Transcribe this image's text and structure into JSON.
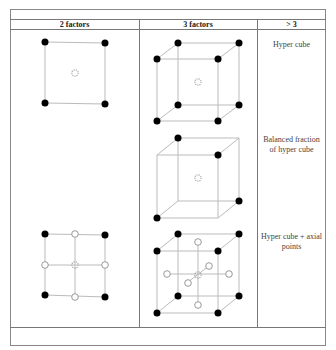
{
  "table": {
    "headers": [
      "2 factors",
      "3 factors",
      "> 3"
    ],
    "rows": [
      {
        "label": "Hyper cube"
      },
      {
        "label": "Balanced fraction of hyper cube",
        "label_line1": "Balanced fraction",
        "label_line2": "of hyper cube"
      },
      {
        "label": "Hyper cube + axial points",
        "label_line1": "Hyper cube + axial",
        "label_line2": "points"
      }
    ]
  },
  "legend": {
    "filled_point": "factorial design point",
    "open_point": "axial design point",
    "center_marker": "center point"
  },
  "colors": {
    "border": "#777777",
    "edge": "#bbbbbb",
    "point": "#000000",
    "center": "#aaaaaa"
  }
}
